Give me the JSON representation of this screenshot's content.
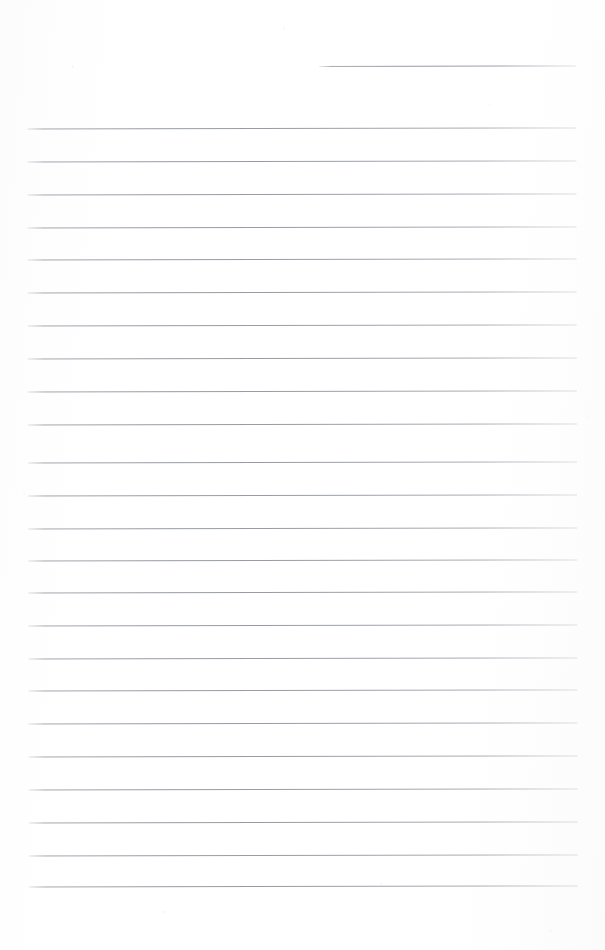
{
  "document": {
    "kind": "scanned-lined-paper",
    "title": "Blank lined notepad page",
    "content_text": "",
    "page_width": 605,
    "page_height": 950,
    "paper_color": "#fefefe",
    "rule_color": "#9aa0a8",
    "rule_thickness_px": 1,
    "rule_spacing_px": 33,
    "rule_left_x": 28,
    "rule_right_x": 577,
    "scan_rotation_deg": -0.12,
    "header_rule": {
      "label": "header-short-rule",
      "y": 66,
      "x_start": 320,
      "x_end": 577,
      "width": 257
    },
    "body_rules": [
      {
        "y": 128
      },
      {
        "y": 161
      },
      {
        "y": 194
      },
      {
        "y": 227
      },
      {
        "y": 259
      },
      {
        "y": 292
      },
      {
        "y": 325
      },
      {
        "y": 358
      },
      {
        "y": 391
      },
      {
        "y": 424
      },
      {
        "y": 462
      },
      {
        "y": 495
      },
      {
        "y": 528
      },
      {
        "y": 560
      },
      {
        "y": 592
      },
      {
        "y": 625
      },
      {
        "y": 658
      },
      {
        "y": 690
      },
      {
        "y": 723
      },
      {
        "y": 756
      },
      {
        "y": 789
      },
      {
        "y": 822
      },
      {
        "y": 855
      },
      {
        "y": 886
      }
    ]
  }
}
